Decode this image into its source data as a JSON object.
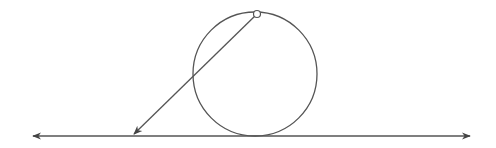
{
  "diagram": {
    "colors": {
      "stroke": "#555555",
      "point_fill": "#ffffff",
      "background": "#ffffff"
    },
    "ground_line": {
      "x1": 33,
      "x2": 470,
      "y": 136,
      "arrows": "both"
    },
    "circle": {
      "cx": 255,
      "cy": 74,
      "r": 62
    },
    "point": {
      "cx": 257,
      "cy": 14,
      "r": 3.5
    },
    "arrow": {
      "x1": 257,
      "y1": 14,
      "x2": 134,
      "y2": 134
    }
  }
}
